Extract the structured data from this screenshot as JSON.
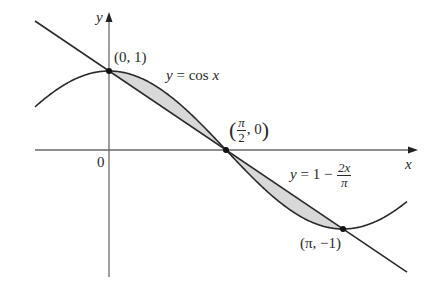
{
  "diagram": {
    "type": "function-plot",
    "colors": {
      "stroke": "#2a2a2a",
      "axis": "#6a6a6a",
      "fill": "#d8d8d8",
      "point": "#111111"
    },
    "axes": {
      "x_label": "x",
      "y_label": "y",
      "origin_label": "0"
    },
    "curves": [
      {
        "name": "cosine",
        "label_lhs": "y",
        "label_eq": "=",
        "label_rhs": "cos",
        "label_var": "x"
      },
      {
        "name": "line",
        "label_lhs": "y",
        "label_eq": "=",
        "label_const": "1 −",
        "label_num": "2x",
        "label_den": "π"
      }
    ],
    "points": [
      {
        "label": "(0, 1)",
        "x": 0,
        "y": 1
      },
      {
        "label_num": "π",
        "label_den": "2",
        "label_rest": ", 0",
        "x": 1.5708,
        "y": 0
      },
      {
        "label": "(π, −1)",
        "x": 3.1416,
        "y": -1
      }
    ],
    "shaded_regions": [
      {
        "between": "y = cos x and y = 1 − 2x/π",
        "from": 0,
        "to": 1.5708
      },
      {
        "between": "y = 1 − 2x/π and y = cos x",
        "from": 1.5708,
        "to": 3.1416
      }
    ]
  }
}
